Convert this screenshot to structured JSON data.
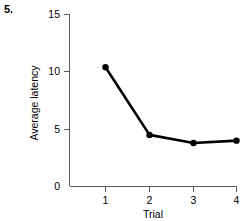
{
  "figure": {
    "item_number": "5.",
    "background_color": "#ffffff",
    "axis_color": "#5a5a5a",
    "series_color": "#000000"
  },
  "chart_data": {
    "type": "line",
    "title": "",
    "xlabel": "Trial",
    "ylabel": "Average latency",
    "x": [
      1,
      2,
      3,
      4
    ],
    "values": [
      10.4,
      4.5,
      3.8,
      4.0
    ],
    "xticks": [
      1,
      2,
      3,
      4
    ],
    "xtick_labels": [
      "1",
      "2",
      "3",
      "4"
    ],
    "yticks": [
      0,
      5,
      10,
      15
    ],
    "ytick_labels": [
      "0",
      "5",
      "10",
      "15"
    ],
    "xlim": [
      0.5,
      4.5
    ],
    "ylim": [
      0,
      15
    ],
    "grid": false,
    "legend": null,
    "marker": "filled-circle",
    "series": [
      {
        "name": "Average latency",
        "values": [
          10.4,
          4.5,
          3.8,
          4.0
        ]
      }
    ]
  }
}
